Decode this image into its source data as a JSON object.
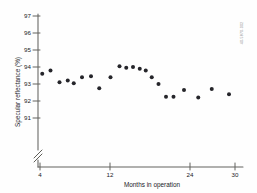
{
  "figure": {
    "credit": "40-5870-002"
  },
  "chart_data": {
    "type": "scatter",
    "title": "",
    "xlabel": "Months in operation",
    "ylabel": "Specular reflectance (%)",
    "xlim": [
      4,
      30
    ],
    "ylim": [
      90.6,
      97
    ],
    "xticks": [
      4,
      12,
      24,
      30
    ],
    "xtick_labels": [
      "4",
      "12",
      "24",
      "30"
    ],
    "yticks": [
      91,
      92,
      93,
      94,
      95,
      96,
      97
    ],
    "ytick_labels": [
      "91",
      "92",
      "93",
      "94",
      "95",
      "96",
      "97"
    ],
    "grid": false,
    "legend": false,
    "axis_break": {
      "axis": "y",
      "note": "double-slash break near origin below 91"
    },
    "marker": {
      "shape": "circle",
      "color": "#25252a",
      "size": 2.0
    },
    "points": [
      {
        "x": 4.3,
        "y": 93.6
      },
      {
        "x": 5.4,
        "y": 93.8
      },
      {
        "x": 6.6,
        "y": 93.1
      },
      {
        "x": 7.7,
        "y": 93.2
      },
      {
        "x": 8.5,
        "y": 93.05
      },
      {
        "x": 9.6,
        "y": 93.4
      },
      {
        "x": 10.8,
        "y": 93.45
      },
      {
        "x": 11.9,
        "y": 92.75
      },
      {
        "x": 13.4,
        "y": 93.4
      },
      {
        "x": 14.6,
        "y": 94.05
      },
      {
        "x": 15.5,
        "y": 93.95
      },
      {
        "x": 16.4,
        "y": 94.0
      },
      {
        "x": 17.3,
        "y": 93.9
      },
      {
        "x": 18.1,
        "y": 93.8
      },
      {
        "x": 18.9,
        "y": 93.4
      },
      {
        "x": 19.8,
        "y": 93.0
      },
      {
        "x": 20.8,
        "y": 92.25
      },
      {
        "x": 21.8,
        "y": 92.25
      },
      {
        "x": 23.2,
        "y": 92.65
      },
      {
        "x": 25.1,
        "y": 92.2
      },
      {
        "x": 26.9,
        "y": 92.7
      },
      {
        "x": 29.2,
        "y": 92.4
      }
    ]
  }
}
